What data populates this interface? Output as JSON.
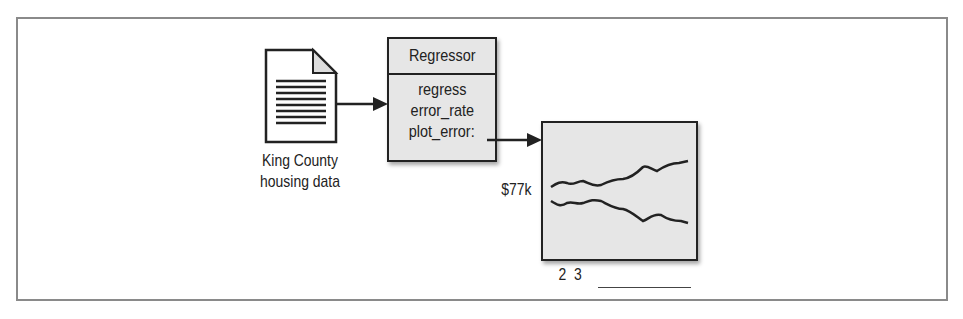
{
  "diagram": {
    "source": {
      "label_line1": "King County",
      "label_line2": "housing data",
      "icon": "document-icon"
    },
    "regressor": {
      "title": "Regressor",
      "methods": [
        "regress",
        "error_rate",
        "plot_error:"
      ]
    },
    "chart": {
      "y_label": "$77k",
      "x_labels": "2  3"
    },
    "colors": {
      "stroke": "#222222",
      "box_fill": "#e6e6e6",
      "frame": "#8a8a8a"
    }
  }
}
